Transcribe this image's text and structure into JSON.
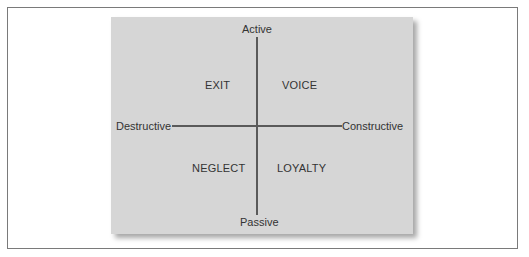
{
  "diagram": {
    "axes": {
      "top": "Active",
      "bottom": "Passive",
      "left": "Destructive",
      "right": "Constructive"
    },
    "quadrants": {
      "top_left": "EXIT",
      "top_right": "VOICE",
      "bottom_left": "NEGLECT",
      "bottom_right": "LOYALTY"
    },
    "colors": {
      "panel": "#d6d6d6",
      "axis_line": "#5a5a5a",
      "text": "#333333",
      "frame_border": "#7a7a7a"
    }
  }
}
